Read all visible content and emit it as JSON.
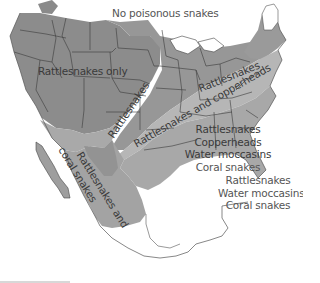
{
  "colors": {
    "rattlesnakes_only": "#8c8c8c",
    "rattlesnakes_band": "#969696",
    "rattlesnakes_and_copperheads": "#b4b4b4",
    "southeast_all": "#a6a6a6",
    "mexico_rattlesnakes_coral": "#a3a3a3",
    "mexico_inner": "#939393",
    "no_poisonous": "#ffffff",
    "border": "#333333"
  },
  "regions": [
    {
      "id": "none",
      "label": "No poisonous snakes"
    },
    {
      "id": "west",
      "label": "Rattlesnakes only"
    },
    {
      "id": "band",
      "label": "Rattlesnakes"
    },
    {
      "id": "band_label_sw",
      "label": "Rattlesnakes"
    },
    {
      "id": "mid",
      "label": "Rattlesnakes and copperheads"
    },
    {
      "id": "southeast",
      "lines": [
        "Rattlesnakes",
        "Copperheads",
        "Water moccasins",
        "Coral snakes"
      ]
    },
    {
      "id": "mexico_west",
      "lines": [
        "Rattlesnakes and",
        "coral snakes"
      ]
    },
    {
      "id": "mexico_east",
      "lines": [
        "Rattlesnakes",
        "Water moccasins",
        "Coral snakes"
      ]
    }
  ]
}
